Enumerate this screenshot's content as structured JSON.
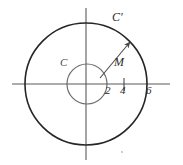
{
  "figure": {
    "background_color": "#ffffff",
    "width": 183,
    "height": 165,
    "origin": {
      "x": 86,
      "y": 84
    }
  },
  "axes": {
    "x_axis": {
      "name": "horizontal-axis",
      "x_start": 12,
      "x_end": 170,
      "y": 84,
      "color": "#5a5a5a"
    },
    "y_axis": {
      "name": "vertical-axis",
      "y_start": 8,
      "y_end": 160,
      "x": 86,
      "color": "#5a5a5a"
    },
    "ticks": [
      {
        "label": "2",
        "value": 2,
        "x": 107,
        "tick_drawn": false
      },
      {
        "label": "4",
        "value": 4,
        "x": 124,
        "tick_drawn": true
      },
      {
        "label": "6",
        "value": 6,
        "x": 147,
        "tick_drawn": false
      }
    ]
  },
  "shapes": {
    "outer_circle": {
      "name": "C'",
      "label": "C'",
      "cx": 86,
      "cy": 84,
      "r": 61,
      "stroke": "#262626",
      "stroke_width": 1.6,
      "radius_units": 6
    },
    "inner_circle": {
      "name": "C",
      "label": "C",
      "cx": 87,
      "cy": 84,
      "r": 20,
      "stroke": "#6b6b6b",
      "stroke_width": 1.2,
      "radius_units": 2
    },
    "vector": {
      "name": "M",
      "label": "M",
      "x1": 100,
      "y1": 78,
      "x2": 131,
      "y2": 41,
      "stroke": "#4a4a4a",
      "stroke_width": 1.1
    },
    "stray_dot": {
      "cx": 122,
      "cy": 152,
      "r": 0.9,
      "fill": "#b8b8b8"
    }
  },
  "labels": {
    "outer_curve": "C'",
    "inner_curve": "C",
    "vector": "M",
    "tick_2": "2",
    "tick_4": "4",
    "tick_6": "6"
  }
}
